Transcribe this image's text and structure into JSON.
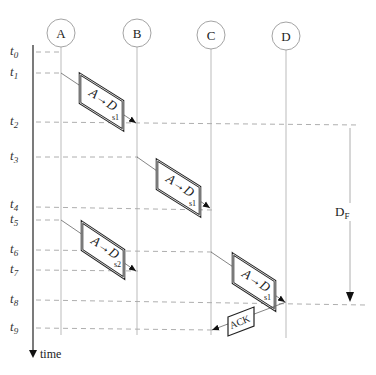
{
  "nodes": [
    {
      "id": "A",
      "label": "A",
      "x": 61,
      "y": 33
    },
    {
      "id": "B",
      "label": "B",
      "x": 137,
      "y": 33
    },
    {
      "id": "C",
      "label": "C",
      "x": 211,
      "y": 35
    },
    {
      "id": "D",
      "label": "D",
      "x": 286,
      "y": 36
    }
  ],
  "time_axis": {
    "label": "time",
    "ticks": [
      {
        "name": "t",
        "sub": "0",
        "y": 52
      },
      {
        "name": "t",
        "sub": "1",
        "y": 73
      },
      {
        "name": "t",
        "sub": "2",
        "y": 122
      },
      {
        "name": "t",
        "sub": "3",
        "y": 157
      },
      {
        "name": "t",
        "sub": "4",
        "y": 207
      },
      {
        "name": "t",
        "sub": "5",
        "y": 220
      },
      {
        "name": "t",
        "sub": "6",
        "y": 250
      },
      {
        "name": "t",
        "sub": "7",
        "y": 270
      },
      {
        "name": "t",
        "sub": "8",
        "y": 300
      },
      {
        "name": "t",
        "sub": "9",
        "y": 328
      }
    ]
  },
  "messages": [
    {
      "label": "A→D",
      "subscript": "s1",
      "from": "A",
      "to": "B",
      "start": "t1",
      "end": "t2"
    },
    {
      "label": "A→D",
      "subscript": "s1",
      "from": "B",
      "to": "C",
      "start": "t3",
      "end": "t4"
    },
    {
      "label": "A→D",
      "subscript": "s2",
      "from": "A",
      "to": "B",
      "start": "t5",
      "end": "t7"
    },
    {
      "label": "A→D",
      "subscript": "s1",
      "from": "C",
      "to": "D",
      "start": "t6",
      "end": "t8"
    },
    {
      "label": "ACK",
      "subscript": "",
      "from": "D",
      "to": "C",
      "start": "t8",
      "end": "t9"
    }
  ],
  "delay": {
    "label": "D",
    "subscript": "F",
    "from": "t2",
    "to": "t8"
  }
}
